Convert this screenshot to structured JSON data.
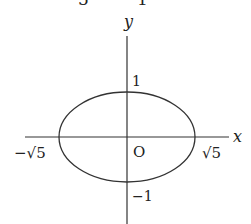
{
  "diagram": {
    "type": "ellipse-on-axes",
    "top_fragment": {
      "left": "5",
      "right": "1"
    },
    "axes": {
      "x_label": "x",
      "y_label": "y",
      "origin_label": "O"
    },
    "ticks": {
      "y_pos": "1",
      "y_neg": "−1",
      "x_pos": "√5",
      "x_neg": "−√5"
    },
    "ellipse": {
      "semi_major_x": "√5",
      "semi_minor_y": "1"
    },
    "colors": {
      "stroke": "#333333",
      "text": "#222222",
      "background": "#ffffff"
    }
  }
}
